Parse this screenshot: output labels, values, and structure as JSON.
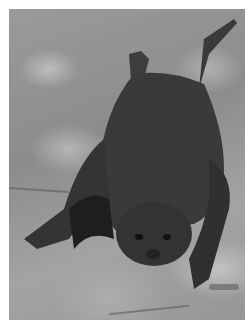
{
  "photo": {
    "subject": "bat hanging on rock",
    "style": "grayscale photograph",
    "colors": {
      "border": "#ffffff",
      "rock": "#9a9a9a",
      "bat_body": "#3a3a3a",
      "bat_shadow": "#1e1e1e"
    }
  }
}
